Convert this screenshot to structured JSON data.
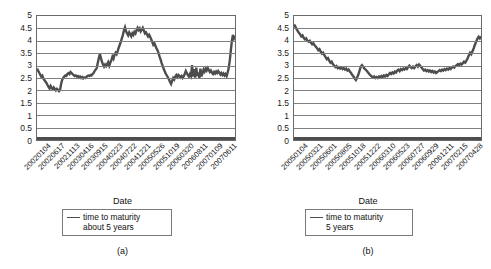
{
  "figure": {
    "panels": [
      {
        "caption": "(a)",
        "xlabel": "Date",
        "legend": {
          "line1": "time to maturity",
          "line2": "about 5 years",
          "indent": false
        }
      },
      {
        "caption": "(b)",
        "xlabel": "Date",
        "legend": {
          "line1": "time to maturity",
          "line2": "5 years",
          "indent": true
        }
      }
    ]
  },
  "chart_data": [
    {
      "type": "line",
      "title": "",
      "xlabel": "Date",
      "ylabel": "",
      "ylim": [
        0,
        5
      ],
      "yticks": [
        0,
        0.5,
        1,
        1.5,
        2,
        2.5,
        3,
        3.5,
        4,
        4.5,
        5
      ],
      "ytick_labels": [
        "0",
        "0.5",
        "1",
        "1.5",
        "2",
        "2.5",
        "3",
        "3.5",
        "4",
        "4.5",
        "5"
      ],
      "grid": true,
      "legend_position": "below",
      "series": [
        {
          "name": "time to maturity about 5 years",
          "color": "#4d4d4d",
          "xtick_labels": [
            "20020104",
            "20020617",
            "20021113",
            "20030416",
            "20030915",
            "20040223",
            "20040722",
            "20041221",
            "20050526",
            "20051019",
            "20060320",
            "20060811",
            "20070109",
            "20070611"
          ],
          "values": [
            2.88,
            2.8,
            2.72,
            2.64,
            2.56,
            2.6,
            2.48,
            2.42,
            2.36,
            2.3,
            2.22,
            2.14,
            2.08,
            2.18,
            2.1,
            2.05,
            2.12,
            2.06,
            2.0,
            2.06,
            2.02,
            1.97,
            2.02,
            2.26,
            2.42,
            2.5,
            2.56,
            2.6,
            2.58,
            2.66,
            2.7,
            2.66,
            2.74,
            2.7,
            2.66,
            2.62,
            2.58,
            2.6,
            2.56,
            2.58,
            2.52,
            2.56,
            2.5,
            2.54,
            2.48,
            2.52,
            2.5,
            2.54,
            2.58,
            2.6,
            2.58,
            2.62,
            2.6,
            2.66,
            2.7,
            2.78,
            2.84,
            2.9,
            3.1,
            3.3,
            3.48,
            3.3,
            3.16,
            3.04,
            2.96,
            3.04,
            2.98,
            3.06,
            3.14,
            3.0,
            3.12,
            3.22,
            3.36,
            3.28,
            3.44,
            3.52,
            3.46,
            3.58,
            3.72,
            3.84,
            3.96,
            4.1,
            4.24,
            4.42,
            4.54,
            4.38,
            4.3,
            4.22,
            4.34,
            4.26,
            4.18,
            4.3,
            4.24,
            4.36,
            4.3,
            4.42,
            4.52,
            4.44,
            4.5,
            4.38,
            4.44,
            4.52,
            4.42,
            4.3,
            4.34,
            4.26,
            4.18,
            4.24,
            4.16,
            4.06,
            3.96,
            3.84,
            3.9,
            3.8,
            3.7,
            3.62,
            3.5,
            3.36,
            3.24,
            3.1,
            2.98,
            2.86,
            2.76,
            2.66,
            2.6,
            2.52,
            2.44,
            2.34,
            2.26,
            2.38,
            2.5,
            2.44,
            2.56,
            2.62,
            2.54,
            2.62,
            2.58,
            2.52,
            2.58,
            2.5,
            2.56,
            2.66,
            2.78,
            2.7,
            2.62,
            2.56,
            2.66,
            2.58,
            3.02,
            2.56,
            2.86,
            2.52,
            2.92,
            2.58,
            2.72,
            2.5,
            2.88,
            2.56,
            2.7,
            2.84,
            2.76,
            2.88,
            2.8,
            2.9,
            2.82,
            2.74,
            2.8,
            2.72,
            2.66,
            2.74,
            2.68,
            2.76,
            2.7,
            2.78,
            2.72,
            2.64,
            2.7,
            2.62,
            2.68,
            2.6,
            2.66,
            2.58,
            2.72,
            2.9,
            3.2,
            3.6,
            4.0,
            4.24,
            4.1,
            4.2
          ]
        }
      ]
    },
    {
      "type": "line",
      "title": "",
      "xlabel": "Date",
      "ylabel": "",
      "ylim": [
        0,
        5
      ],
      "yticks": [
        0,
        0.5,
        1,
        1.5,
        2,
        2.5,
        3,
        3.5,
        4,
        4.5,
        5
      ],
      "ytick_labels": [
        "0",
        "0.5",
        "1",
        "1.5",
        "2",
        "2.5",
        "3",
        "3.5",
        "4",
        "4.5",
        "5"
      ],
      "grid": true,
      "legend_position": "below",
      "series": [
        {
          "name": "time to maturity 5 years",
          "color": "#4d4d4d",
          "xtick_labels": [
            "20050104",
            "20050321",
            "20050601",
            "20050805",
            "20051018",
            "20051222",
            "20060310",
            "20060523",
            "20060727",
            "20060929",
            "20061211",
            "20070215",
            "20070428"
          ],
          "values": [
            4.66,
            4.58,
            4.48,
            4.4,
            4.32,
            4.26,
            4.18,
            4.22,
            4.12,
            4.06,
            4.1,
            4.0,
            3.96,
            4.0,
            3.92,
            3.86,
            3.9,
            3.82,
            3.76,
            3.7,
            3.62,
            3.66,
            3.56,
            3.48,
            3.52,
            3.42,
            3.34,
            3.26,
            3.3,
            3.2,
            3.12,
            3.16,
            3.06,
            3.0,
            2.94,
            2.98,
            2.9,
            2.94,
            2.88,
            2.92,
            2.86,
            2.9,
            2.84,
            2.88,
            2.8,
            2.84,
            2.76,
            2.7,
            2.62,
            2.56,
            2.48,
            2.42,
            2.52,
            2.64,
            2.8,
            2.96,
            3.02,
            2.96,
            2.88,
            2.84,
            2.78,
            2.72,
            2.66,
            2.6,
            2.56,
            2.52,
            2.56,
            2.5,
            2.54,
            2.5,
            2.56,
            2.52,
            2.58,
            2.54,
            2.6,
            2.56,
            2.62,
            2.58,
            2.64,
            2.7,
            2.66,
            2.72,
            2.68,
            2.76,
            2.72,
            2.8,
            2.84,
            2.78,
            2.86,
            2.82,
            2.88,
            2.84,
            2.9,
            2.86,
            2.94,
            3.0,
            2.94,
            2.9,
            2.96,
            2.9,
            2.96,
            3.02,
            2.96,
            3.04,
            2.98,
            2.92,
            2.86,
            2.8,
            2.84,
            2.78,
            2.82,
            2.76,
            2.8,
            2.74,
            2.78,
            2.72,
            2.76,
            2.7,
            2.74,
            2.78,
            2.82,
            2.78,
            2.84,
            2.8,
            2.86,
            2.82,
            2.88,
            2.84,
            2.9,
            2.86,
            2.92,
            2.96,
            2.92,
            2.98,
            3.02,
            3.06,
            3.02,
            3.08,
            3.04,
            3.1,
            3.16,
            3.12,
            3.2,
            3.3,
            3.42,
            3.52,
            3.46,
            3.58,
            3.7,
            3.84,
            3.96,
            4.08,
            4.16,
            4.1,
            4.18
          ]
        }
      ]
    }
  ]
}
